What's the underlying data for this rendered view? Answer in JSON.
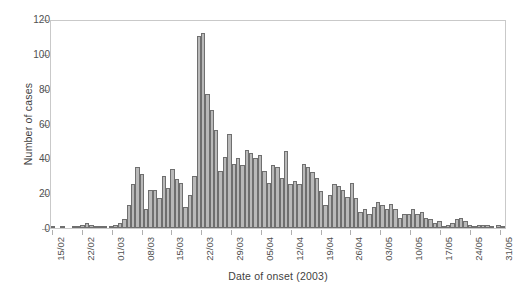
{
  "chart_data": {
    "type": "bar",
    "title": "",
    "xlabel": "Date of onset (2003)",
    "ylabel": "Number of cases",
    "ylim": [
      0,
      120
    ],
    "yticks": [
      0,
      20,
      40,
      60,
      80,
      100,
      120
    ],
    "grid": false,
    "legend": null,
    "bar_color": "#b9b9b9",
    "bar_edge_color": "#6f6f6f",
    "axis_color": "#c9c9c9",
    "x_tick_labels": [
      "15/02",
      "22/02",
      "01/03",
      "08/03",
      "15/03",
      "22/03",
      "29/03",
      "05/04",
      "12/04",
      "19/04",
      "26/04",
      "03/05",
      "10/05",
      "17/05",
      "24/05",
      "31/05"
    ],
    "x_tick_indices": [
      0,
      7,
      14,
      21,
      28,
      35,
      42,
      49,
      56,
      63,
      70,
      77,
      84,
      91,
      98,
      105
    ],
    "x_start_date": "15/02",
    "x_end_date": "31/05",
    "n_bars": 107,
    "categories": [
      "15/02",
      "16/02",
      "17/02",
      "18/02",
      "19/02",
      "20/02",
      "21/02",
      "22/02",
      "23/02",
      "24/02",
      "25/02",
      "26/02",
      "27/02",
      "28/02",
      "01/03",
      "02/03",
      "03/03",
      "04/03",
      "05/03",
      "06/03",
      "07/03",
      "08/03",
      "09/03",
      "10/03",
      "11/03",
      "12/03",
      "13/03",
      "14/03",
      "15/03",
      "16/03",
      "17/03",
      "18/03",
      "19/03",
      "20/03",
      "21/03",
      "22/03",
      "23/03",
      "24/03",
      "25/03",
      "26/03",
      "27/03",
      "28/03",
      "29/03",
      "30/03",
      "31/03",
      "01/04",
      "02/04",
      "03/04",
      "04/04",
      "05/04",
      "06/04",
      "07/04",
      "08/04",
      "09/04",
      "10/04",
      "11/04",
      "12/04",
      "13/04",
      "14/04",
      "15/04",
      "16/04",
      "17/04",
      "18/04",
      "19/04",
      "20/04",
      "21/04",
      "22/04",
      "23/04",
      "24/04",
      "25/04",
      "26/04",
      "27/04",
      "28/04",
      "29/04",
      "30/04",
      "01/05",
      "02/05",
      "03/05",
      "04/05",
      "05/05",
      "06/05",
      "07/05",
      "08/05",
      "09/05",
      "10/05",
      "11/05",
      "12/05",
      "13/05",
      "14/05",
      "15/05",
      "16/05",
      "17/05",
      "18/05",
      "19/05",
      "20/05",
      "21/05",
      "22/05",
      "23/05",
      "24/05",
      "25/05",
      "26/05",
      "27/05",
      "28/05",
      "29/05",
      "30/05",
      "31/05",
      "01/06"
    ],
    "values": [
      1,
      0,
      0,
      1,
      0,
      0,
      0,
      1,
      1,
      2,
      3,
      2,
      1,
      1,
      1,
      0,
      1,
      2,
      3,
      5,
      13,
      25,
      35,
      31,
      11,
      22,
      22,
      17,
      30,
      23,
      34,
      28,
      26,
      12,
      19,
      30,
      110,
      112,
      77,
      68,
      56,
      33,
      41,
      54,
      37,
      40,
      36,
      45,
      43,
      40,
      42,
      33,
      26,
      36,
      35,
      29,
      44,
      25,
      27,
      25,
      37,
      35,
      32,
      29,
      21,
      13,
      19,
      25,
      24,
      22,
      18,
      26,
      17,
      9,
      11,
      8,
      12,
      15,
      13,
      11,
      14,
      11,
      6,
      8,
      8,
      11,
      8,
      9,
      6,
      5,
      3,
      4,
      1,
      2,
      3,
      5,
      6,
      4,
      2,
      1,
      2,
      2,
      2,
      1,
      0,
      2,
      1
    ]
  }
}
